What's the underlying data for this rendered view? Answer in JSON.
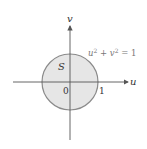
{
  "diagram": {
    "region_label": "S",
    "x_axis_label": "u",
    "y_axis_label": "v",
    "origin_label": "0",
    "tick_label": "1",
    "equation": {
      "base1": "u",
      "sup1": "2",
      "plus": " + ",
      "base2": "v",
      "sup2": "2",
      "rhs": " = 1"
    },
    "colors": {
      "region_fill": "#e6e6e6",
      "circle_stroke": "#8a8a8a",
      "axis_stroke": "#555555"
    }
  }
}
